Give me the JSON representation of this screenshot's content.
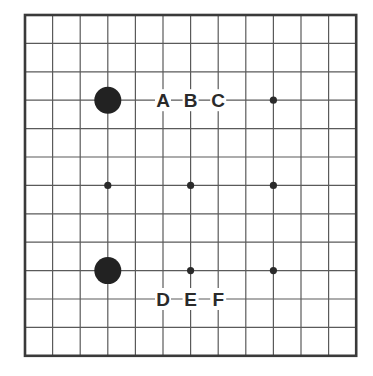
{
  "diagram": {
    "type": "go-board-fragment",
    "grid": {
      "columns": 13,
      "rows": 13,
      "x0": 25,
      "y0": 15,
      "dx": 27.6,
      "dy": 28.4
    },
    "colors": {
      "line": "#5a5a5a",
      "border": "#3a3a3a",
      "stone_black": "#222222",
      "star": "#2a2a2a",
      "label": "#2a2a2a",
      "background": "#ffffff"
    },
    "stones": [
      {
        "color": "black",
        "col": 3,
        "row": 3
      },
      {
        "color": "black",
        "col": 3,
        "row": 9
      }
    ],
    "star_points": [
      {
        "col": 9,
        "row": 3
      },
      {
        "col": 3,
        "row": 6
      },
      {
        "col": 6,
        "row": 6
      },
      {
        "col": 9,
        "row": 6
      },
      {
        "col": 6,
        "row": 9
      },
      {
        "col": 9,
        "row": 9
      }
    ],
    "labels": [
      {
        "text": "A",
        "col": 5,
        "row": 3
      },
      {
        "text": "B",
        "col": 6,
        "row": 3
      },
      {
        "text": "C",
        "col": 7,
        "row": 3
      },
      {
        "text": "D",
        "col": 5,
        "row": 10
      },
      {
        "text": "E",
        "col": 6,
        "row": 10
      },
      {
        "text": "F",
        "col": 7,
        "row": 10
      }
    ]
  }
}
